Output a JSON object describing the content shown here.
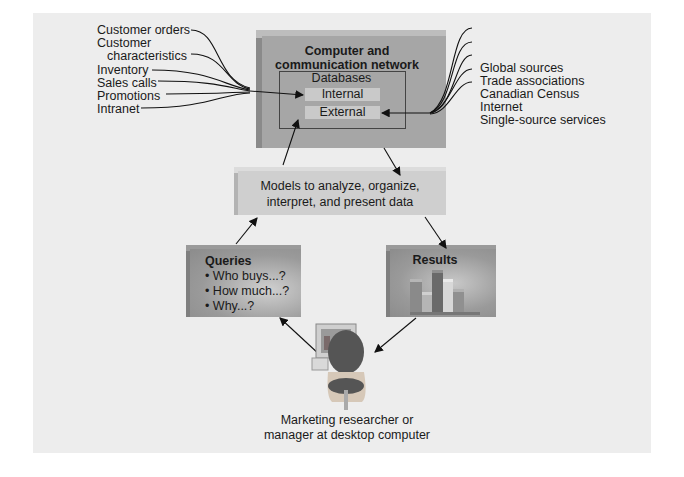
{
  "diagram": {
    "colors": {
      "background": "#ededed",
      "box_face": "#a6a6a6",
      "box_side": "#8c8c8c",
      "models_face": "#cfcfcf",
      "db_item": "#c9c9c9",
      "arrow": "#111111"
    },
    "left_sources": [
      {
        "label": "Customer orders"
      },
      {
        "label": "Customer"
      },
      {
        "label": "characteristics"
      },
      {
        "label": "Inventory"
      },
      {
        "label": "Sales calls"
      },
      {
        "label": "Promotions"
      },
      {
        "label": "Intranet"
      }
    ],
    "right_sources": [
      {
        "label": "Global sources"
      },
      {
        "label": "Trade associations"
      },
      {
        "label": "Canadian Census"
      },
      {
        "label": "Internet"
      },
      {
        "label": "Single-source services"
      }
    ],
    "network_box": {
      "title_line1": "Computer and",
      "title_line2": "communication network",
      "databases_title": "Databases",
      "internal": "Internal",
      "external": "External"
    },
    "models_box": {
      "line1": "Models to analyze, organize,",
      "line2": "interpret, and present data"
    },
    "queries_box": {
      "title": "Queries",
      "items": [
        "• Who buys...?",
        "• How much...?",
        "• Why...?"
      ]
    },
    "results_box": {
      "title": "Results",
      "icon": "bar-chart-icon"
    },
    "user": {
      "icon": "person-at-computer-icon",
      "caption_line1": "Marketing researcher or",
      "caption_line2": "manager at desktop computer"
    }
  }
}
